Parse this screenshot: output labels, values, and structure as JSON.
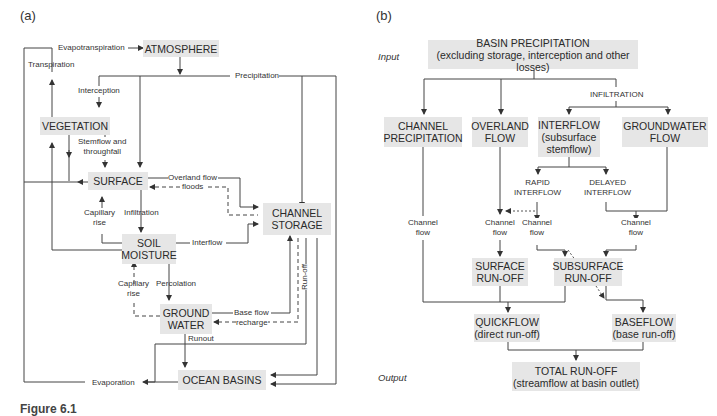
{
  "panel_a": {
    "label": "(a)",
    "boxes": {
      "atmosphere": "ATMOSPHERE",
      "vegetation": "VEGETATION",
      "surface": "SURFACE",
      "channel_storage_1": "CHANNEL",
      "channel_storage_2": "STORAGE",
      "soil_moisture_1": "SOIL",
      "soil_moisture_2": "MOISTURE",
      "ground_water_1": "GROUND",
      "ground_water_2": "WATER",
      "ocean_basins": "OCEAN BASINS"
    },
    "labels": {
      "evapotranspiration": "Evapotranspiration",
      "transpiration": "Transpiration",
      "precipitation": "Precipitation",
      "interception": "Interception",
      "stemflow_1": "Stemflow and",
      "stemflow_2": "throughfall",
      "overland_flow": "Overland flow",
      "floods": "floods",
      "capillary_rise_1": "Capillary",
      "capillary_rise_2": "rise",
      "infiltration": "Infiltration",
      "interflow": "Interflow",
      "capillary_rise2_1": "Capillary",
      "capillary_rise2_2": "rise",
      "percolation": "Percolation",
      "base_flow": "Base flow",
      "recharge": "recharge",
      "runout": "Runout",
      "run_off": "Run-off",
      "evaporation": "Evaporation"
    }
  },
  "panel_b": {
    "label": "(b)",
    "input_label": "Input",
    "output_label": "Output",
    "boxes": {
      "basin_precip_1": "BASIN PRECIPITATION",
      "basin_precip_2": "(excluding storage, interception and other losses)",
      "channel_precip_1": "CHANNEL",
      "channel_precip_2": "PRECIPITATION",
      "overland_1": "OVERLAND",
      "overland_2": "FLOW",
      "interflow_1": "INTERFLOW",
      "interflow_2": "(subsurface",
      "interflow_3": "stemflow)",
      "groundwater_1": "GROUNDWATER",
      "groundwater_2": "FLOW",
      "surface_runoff_1": "SURFACE",
      "surface_runoff_2": "RUN-OFF",
      "subsurface_runoff_1": "SUBSURFACE",
      "subsurface_runoff_2": "RUN-OFF",
      "quickflow_1": "QUICKFLOW",
      "quickflow_2": "(direct run-off)",
      "baseflow_1": "BASEFLOW",
      "baseflow_2": "(base run-off)",
      "total_runoff_1": "TOTAL RUN-OFF",
      "total_runoff_2": "(streamflow at basin outlet)"
    },
    "labels": {
      "infiltration": "INFILTRATION",
      "rapid_1": "RAPID",
      "rapid_2": "INTERFLOW",
      "delayed_1": "DELAYED",
      "delayed_2": "INTERFLOW",
      "channel_flow": "Channel",
      "flow": "flow"
    }
  },
  "caption": "Figure 6.1"
}
